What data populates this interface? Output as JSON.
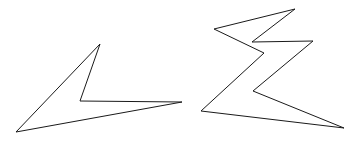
{
  "diagram": {
    "background": "#ffffff",
    "stroke_color": "#1a1a1a",
    "shapes": [
      {
        "id": "arrowhead-shape",
        "type": "polygon",
        "points": "100,44 80,101 182,102 16,132"
      },
      {
        "id": "zigzag-shape",
        "type": "polygon",
        "points": "295,9 214,29 264,53 201,111 344,128 253,91 313,41 252,42"
      }
    ]
  }
}
